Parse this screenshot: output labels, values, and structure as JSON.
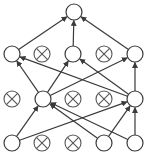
{
  "diagram": {
    "colors": {
      "stroke": "#3a3a3a",
      "dropped_stroke": "#555555",
      "background": "#ffffff"
    },
    "node_radius": 8,
    "nodes": [
      {
        "id": "out",
        "layer": 0,
        "x": 74,
        "y": 12,
        "dropped": false
      },
      {
        "id": "h1a",
        "layer": 1,
        "x": 12,
        "y": 54,
        "dropped": false
      },
      {
        "id": "h1b",
        "layer": 1,
        "x": 42,
        "y": 54,
        "dropped": true
      },
      {
        "id": "h1c",
        "layer": 1,
        "x": 73,
        "y": 54,
        "dropped": false
      },
      {
        "id": "h1d",
        "layer": 1,
        "x": 104,
        "y": 54,
        "dropped": true
      },
      {
        "id": "h1e",
        "layer": 1,
        "x": 135,
        "y": 54,
        "dropped": false
      },
      {
        "id": "h2a",
        "layer": 2,
        "x": 12,
        "y": 99,
        "dropped": true
      },
      {
        "id": "h2b",
        "layer": 2,
        "x": 43,
        "y": 99,
        "dropped": false
      },
      {
        "id": "h2c",
        "layer": 2,
        "x": 73,
        "y": 99,
        "dropped": true
      },
      {
        "id": "h2d",
        "layer": 2,
        "x": 104,
        "y": 99,
        "dropped": true
      },
      {
        "id": "h2e",
        "layer": 2,
        "x": 135,
        "y": 99,
        "dropped": false
      },
      {
        "id": "in1",
        "layer": 3,
        "x": 12,
        "y": 143,
        "dropped": false
      },
      {
        "id": "in2",
        "layer": 3,
        "x": 42,
        "y": 143,
        "dropped": true
      },
      {
        "id": "in3",
        "layer": 3,
        "x": 73,
        "y": 143,
        "dropped": true
      },
      {
        "id": "in4",
        "layer": 3,
        "x": 104,
        "y": 143,
        "dropped": false
      },
      {
        "id": "in5",
        "layer": 3,
        "x": 135,
        "y": 143,
        "dropped": false
      }
    ],
    "edges": [
      {
        "from": "h1a",
        "to": "out"
      },
      {
        "from": "h1c",
        "to": "out"
      },
      {
        "from": "h1e",
        "to": "out"
      },
      {
        "from": "h2b",
        "to": "h1a"
      },
      {
        "from": "h2e",
        "to": "h1a"
      },
      {
        "from": "h2b",
        "to": "h1c"
      },
      {
        "from": "h2e",
        "to": "h1c"
      },
      {
        "from": "h2b",
        "to": "h1e"
      },
      {
        "from": "h2e",
        "to": "h1e"
      },
      {
        "from": "in1",
        "to": "h2b"
      },
      {
        "from": "in4",
        "to": "h2b"
      },
      {
        "from": "in5",
        "to": "h2b"
      },
      {
        "from": "in1",
        "to": "h2e"
      },
      {
        "from": "in4",
        "to": "h2e"
      },
      {
        "from": "in5",
        "to": "h2e"
      }
    ]
  }
}
